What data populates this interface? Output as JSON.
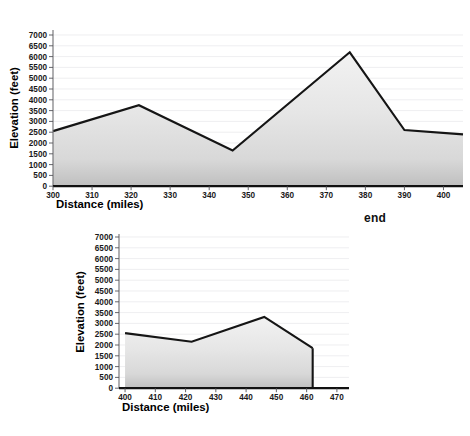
{
  "labels": {
    "end_marker": "end"
  },
  "chart_data": [
    {
      "type": "area",
      "title": "",
      "xlabel": "Distance (miles)",
      "ylabel": "Elevation (feet)",
      "xlim": [
        300,
        405
      ],
      "ylim": [
        0,
        7000
      ],
      "xticks": [
        300,
        310,
        320,
        330,
        340,
        350,
        360,
        370,
        380,
        390,
        400
      ],
      "yticks": [
        0,
        500,
        1000,
        1500,
        2000,
        2500,
        3000,
        3500,
        4000,
        4500,
        5000,
        5500,
        6000,
        6500,
        7000
      ],
      "grid": true,
      "legend": "none",
      "x": [
        300,
        322,
        346,
        376,
        390,
        405
      ],
      "values": [
        2550,
        3750,
        1650,
        6200,
        2600,
        2400
      ]
    },
    {
      "type": "area",
      "title": "",
      "xlabel": "Distance (miles)",
      "ylabel": "Elevation (feet)",
      "xlim": [
        398,
        474
      ],
      "ylim": [
        0,
        7000
      ],
      "xticks": [
        400,
        410,
        420,
        430,
        440,
        450,
        460,
        470
      ],
      "yticks": [
        0,
        500,
        1000,
        1500,
        2000,
        2500,
        3000,
        3500,
        4000,
        4500,
        5000,
        5500,
        6000,
        6500,
        7000
      ],
      "grid": true,
      "legend": "none",
      "x": [
        400,
        422,
        446,
        462
      ],
      "values": [
        2550,
        2150,
        3300,
        1850
      ]
    }
  ]
}
